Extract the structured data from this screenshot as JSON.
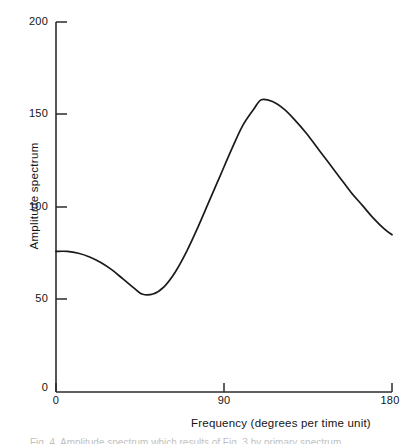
{
  "chart_data": {
    "type": "line",
    "title": "",
    "xlabel": "Frequency (degrees per time unit)",
    "ylabel": "Amplitude spectrum",
    "xlim": [
      0,
      180
    ],
    "ylim": [
      0,
      200
    ],
    "xticks": [
      0,
      90,
      180
    ],
    "xtick_labels": [
      "0",
      "90",
      "180"
    ],
    "yticks": [
      0,
      50,
      100,
      150,
      200
    ],
    "ytick_labels": [
      "0",
      "50",
      "100",
      "150",
      "200"
    ],
    "grid": false,
    "legend": null,
    "series": [
      {
        "name": "amplitude spectrum",
        "color": "#1a1a1a",
        "x": [
          0,
          6,
          12,
          18,
          24,
          30,
          36,
          42,
          46,
          52,
          58,
          64,
          70,
          76,
          82,
          88,
          94,
          100,
          106,
          110,
          116,
          122,
          128,
          134,
          140,
          146,
          152,
          158,
          164,
          170,
          176,
          180
        ],
        "y": [
          76,
          76,
          75,
          73,
          70,
          66,
          61,
          56,
          53,
          53,
          57,
          65,
          76,
          89,
          103,
          117,
          131,
          144,
          153,
          158,
          157,
          153,
          147,
          140,
          132,
          124,
          116,
          108,
          101,
          94,
          88,
          85
        ]
      }
    ],
    "annotations": {
      "start_value": 76,
      "trough": {
        "x": 48,
        "y": 52
      },
      "peak": {
        "x": 110,
        "y": 158
      },
      "end_value": 85
    }
  },
  "axis": {
    "y_title": "Amplitude spectrum",
    "x_title": "Frequency (degrees per time unit)",
    "y_labels": {
      "t200": "200",
      "t150": "150",
      "t100": "100",
      "t50": "50",
      "t0": "0"
    },
    "x_labels": {
      "t0": "0",
      "t90": "90",
      "t180": "180"
    }
  },
  "caption": {
    "text": "Fig. 4. Amplitude spectrum which results of Fig. 3 by primary spectrum"
  },
  "colors": {
    "curve": "#1a1a1a",
    "axis": "#2b2b2b",
    "text": "#141414",
    "background": "#ffffff"
  }
}
